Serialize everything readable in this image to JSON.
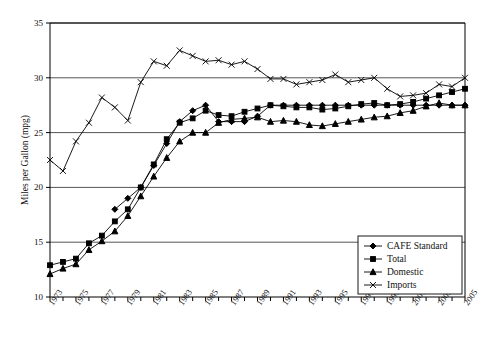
{
  "chart_data": {
    "type": "line",
    "title": "",
    "xlabel": "",
    "ylabel": "Miles per Gallon (mpg)",
    "ylim": [
      10,
      35
    ],
    "ytick_labels": [
      "10",
      "15",
      "20",
      "25",
      "30",
      "35"
    ],
    "yticks": [
      10,
      15,
      20,
      25,
      30,
      35
    ],
    "xlim": [
      1973,
      2005
    ],
    "xtick_labels": [
      "1973",
      "1975",
      "1977",
      "1979",
      "1981",
      "1983",
      "1985",
      "1987",
      "1989",
      "1991",
      "1993",
      "1995",
      "1997",
      "1999",
      "2001",
      "2003",
      "2005"
    ],
    "xticks": [
      1973,
      1975,
      1977,
      1979,
      1981,
      1983,
      1985,
      1987,
      1989,
      1991,
      1993,
      1995,
      1997,
      1999,
      2001,
      2003,
      2005
    ],
    "x": [
      1973,
      1974,
      1975,
      1976,
      1977,
      1978,
      1979,
      1980,
      1981,
      1982,
      1983,
      1984,
      1985,
      1986,
      1987,
      1988,
      1989,
      1990,
      1991,
      1992,
      1993,
      1994,
      1995,
      1996,
      1997,
      1998,
      1999,
      2000,
      2001,
      2002,
      2003,
      2004,
      2005
    ],
    "grid": "horizontal",
    "legend_position": "bottom-right",
    "series": [
      {
        "name": "CAFE Standard",
        "marker": "diamond",
        "values": [
          null,
          null,
          null,
          null,
          null,
          18.0,
          19.0,
          20.0,
          22.0,
          24.0,
          26.0,
          27.0,
          27.5,
          26.0,
          26.0,
          26.0,
          26.5,
          27.5,
          27.5,
          27.5,
          27.5,
          27.5,
          27.5,
          27.5,
          27.5,
          27.5,
          27.5,
          27.5,
          27.5,
          27.5,
          27.5,
          27.5,
          27.5
        ]
      },
      {
        "name": "Total",
        "marker": "square",
        "values": [
          12.9,
          13.2,
          13.5,
          14.9,
          15.6,
          16.9,
          18.0,
          20.0,
          22.1,
          24.4,
          25.9,
          26.3,
          27.0,
          26.6,
          26.5,
          26.9,
          27.2,
          27.5,
          27.4,
          27.3,
          27.3,
          27.1,
          27.2,
          27.4,
          27.6,
          27.7,
          27.5,
          27.6,
          27.8,
          28.1,
          28.4,
          28.7,
          29.0
        ]
      },
      {
        "name": "Domestic",
        "marker": "triangle",
        "values": [
          12.1,
          12.6,
          13.0,
          14.3,
          15.1,
          16.0,
          17.4,
          19.2,
          21.0,
          22.7,
          24.2,
          25.0,
          25.0,
          25.9,
          26.2,
          26.3,
          26.4,
          26.0,
          26.1,
          26.0,
          25.7,
          25.6,
          25.8,
          26.0,
          26.2,
          26.4,
          26.5,
          26.8,
          27.0,
          27.4,
          27.7,
          27.5,
          27.5
        ]
      },
      {
        "name": "Imports",
        "marker": "x",
        "values": [
          22.5,
          21.5,
          24.2,
          25.9,
          28.2,
          27.3,
          26.1,
          29.6,
          31.5,
          31.1,
          32.5,
          32.0,
          31.5,
          31.6,
          31.2,
          31.5,
          30.8,
          29.9,
          29.9,
          29.4,
          29.6,
          29.8,
          30.3,
          29.6,
          29.8,
          30.0,
          29.0,
          28.3,
          28.4,
          28.6,
          29.4,
          29.2,
          30.0
        ]
      }
    ]
  },
  "legend": {
    "items": [
      {
        "label": "CAFE Standard",
        "marker": "diamond"
      },
      {
        "label": "Total",
        "marker": "square"
      },
      {
        "label": "Domestic",
        "marker": "triangle"
      },
      {
        "label": "Imports",
        "marker": "x"
      }
    ]
  }
}
